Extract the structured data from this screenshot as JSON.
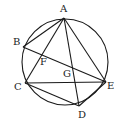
{
  "figure": {
    "type": "geometry",
    "circle": {
      "cx": 65,
      "cy": 62,
      "r": 43
    },
    "points": {
      "A": {
        "x": 64,
        "y": 18,
        "label": "A",
        "lx": 60,
        "ly": 12
      },
      "B": {
        "x": 23,
        "y": 47,
        "label": "B",
        "lx": 13,
        "ly": 45
      },
      "C": {
        "x": 25,
        "y": 83,
        "label": "C",
        "lx": 14,
        "ly": 90
      },
      "D": {
        "x": 79,
        "y": 106,
        "label": "D",
        "lx": 79,
        "ly": 117
      },
      "E": {
        "x": 106,
        "y": 82,
        "label": "E",
        "lx": 107,
        "ly": 89
      },
      "F": {
        "x": 43,
        "y": 54,
        "label": "F",
        "lx": 40,
        "ly": 65
      },
      "G": {
        "x": 72,
        "y": 68,
        "label": "G",
        "lx": 64,
        "ly": 77
      }
    },
    "segments": [
      "AB",
      "BE",
      "AC",
      "AE",
      "AD",
      "CE",
      "CD",
      "DE"
    ],
    "stroke_color": "#1a1a1a"
  }
}
